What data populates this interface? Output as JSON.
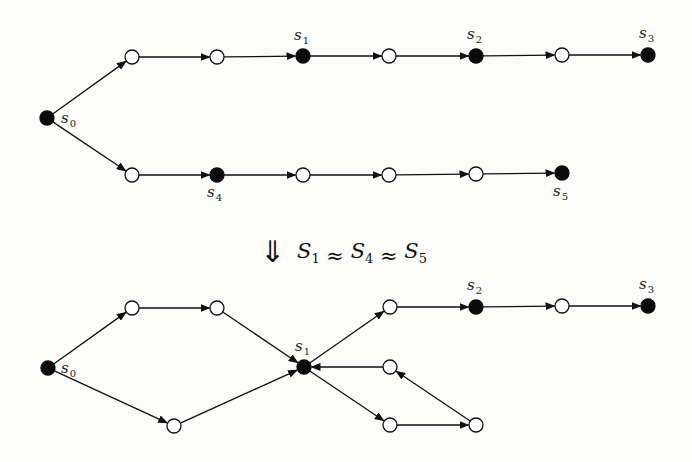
{
  "diagram": {
    "type": "state-graph-merge",
    "top_graph": {
      "nodes": [
        {
          "id": "s0",
          "x": 47,
          "y": 118,
          "filled": true,
          "label": "s",
          "sub": "0",
          "lx": 61,
          "ly": 123
        },
        {
          "id": "t1",
          "x": 132,
          "y": 57,
          "filled": false
        },
        {
          "id": "t2",
          "x": 217,
          "y": 57,
          "filled": false
        },
        {
          "id": "s1",
          "x": 303,
          "y": 56,
          "filled": true,
          "label": "s",
          "sub": "1",
          "lx": 294,
          "ly": 40
        },
        {
          "id": "t3",
          "x": 389,
          "y": 56,
          "filled": false
        },
        {
          "id": "s2",
          "x": 476,
          "y": 56,
          "filled": true,
          "label": "s",
          "sub": "2",
          "lx": 467,
          "ly": 39
        },
        {
          "id": "t4",
          "x": 562,
          "y": 55,
          "filled": false
        },
        {
          "id": "s3",
          "x": 648,
          "y": 55,
          "filled": true,
          "label": "s",
          "sub": "3",
          "lx": 639,
          "ly": 38
        },
        {
          "id": "b1",
          "x": 132,
          "y": 175,
          "filled": false
        },
        {
          "id": "s4",
          "x": 217,
          "y": 175,
          "filled": true,
          "label": "s",
          "sub": "4",
          "lx": 207,
          "ly": 197
        },
        {
          "id": "b2",
          "x": 303,
          "y": 175,
          "filled": false
        },
        {
          "id": "b3",
          "x": 389,
          "y": 175,
          "filled": false
        },
        {
          "id": "b4",
          "x": 476,
          "y": 174,
          "filled": false
        },
        {
          "id": "s5",
          "x": 562,
          "y": 173,
          "filled": true,
          "label": "s",
          "sub": "5",
          "lx": 553,
          "ly": 196
        }
      ],
      "edges": [
        [
          "s0",
          "t1"
        ],
        [
          "t1",
          "t2"
        ],
        [
          "t2",
          "s1"
        ],
        [
          "s1",
          "t3"
        ],
        [
          "t3",
          "s2"
        ],
        [
          "s2",
          "t4"
        ],
        [
          "t4",
          "s3"
        ],
        [
          "s0",
          "b1"
        ],
        [
          "b1",
          "s4"
        ],
        [
          "s4",
          "b2"
        ],
        [
          "b2",
          "b3"
        ],
        [
          "b3",
          "b4"
        ],
        [
          "b4",
          "s5"
        ]
      ]
    },
    "transition": {
      "symbol": "⇓",
      "terms": [
        {
          "letter": "S",
          "sub": "1"
        },
        {
          "letter": "S",
          "sub": "4"
        },
        {
          "letter": "S",
          "sub": "5"
        }
      ],
      "relation": "≈",
      "text": "S1 ≈ S4 ≈ S5"
    },
    "bottom_graph": {
      "nodes": [
        {
          "id": "s0",
          "x": 48,
          "y": 368,
          "filled": true,
          "label": "s",
          "sub": "0",
          "lx": 61,
          "ly": 373
        },
        {
          "id": "a",
          "x": 132,
          "y": 308,
          "filled": false
        },
        {
          "id": "b",
          "x": 217,
          "y": 308,
          "filled": false
        },
        {
          "id": "c",
          "x": 174,
          "y": 426,
          "filled": false
        },
        {
          "id": "s1",
          "x": 304,
          "y": 367,
          "filled": true,
          "label": "s",
          "sub": "1",
          "lx": 295,
          "ly": 351
        },
        {
          "id": "d",
          "x": 390,
          "y": 307,
          "filled": false
        },
        {
          "id": "s2",
          "x": 476,
          "y": 307,
          "filled": true,
          "label": "s",
          "sub": "2",
          "lx": 467,
          "ly": 290
        },
        {
          "id": "h",
          "x": 562,
          "y": 306,
          "filled": false
        },
        {
          "id": "s3",
          "x": 648,
          "y": 306,
          "filled": true,
          "label": "s",
          "sub": "3",
          "lx": 639,
          "ly": 289
        },
        {
          "id": "e",
          "x": 390,
          "y": 367,
          "filled": false
        },
        {
          "id": "f",
          "x": 390,
          "y": 425,
          "filled": false
        },
        {
          "id": "g",
          "x": 476,
          "y": 425,
          "filled": false
        }
      ],
      "edges": [
        [
          "s0",
          "a"
        ],
        [
          "a",
          "b"
        ],
        [
          "b",
          "s1"
        ],
        [
          "s0",
          "c"
        ],
        [
          "c",
          "s1"
        ],
        [
          "s1",
          "d"
        ],
        [
          "d",
          "s2"
        ],
        [
          "s2",
          "h"
        ],
        [
          "h",
          "s3"
        ],
        [
          "s1",
          "f"
        ],
        [
          "f",
          "g"
        ],
        [
          "g",
          "e"
        ],
        [
          "e",
          "s1"
        ]
      ]
    },
    "style": {
      "line_color": "#111111",
      "filled_color": "#0a0a0a",
      "open_fill": "#ffffff",
      "background": "#fcfcfa",
      "node_radius": 7
    }
  }
}
